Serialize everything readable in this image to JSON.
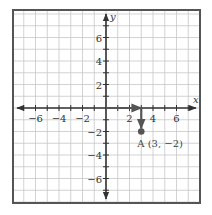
{
  "chart_data": {
    "type": "scatter",
    "title": "",
    "xlabel": "x",
    "ylabel": "y",
    "xlim": [
      -7.5,
      7.5
    ],
    "ylim": [
      -7.5,
      7.5
    ],
    "grid": true,
    "x_ticks": [
      -6,
      -4,
      -2,
      2,
      4,
      6
    ],
    "y_ticks": [
      6,
      4,
      2,
      -2,
      -4,
      -6
    ],
    "x_tick_labels": [
      "−6",
      "−4",
      "−2",
      "2",
      "4",
      "6"
    ],
    "y_tick_labels": [
      "6",
      "4",
      "2",
      "−2",
      "−4",
      "−6"
    ],
    "points": [
      {
        "name": "A",
        "x": 3,
        "y": -2,
        "label": "A (3, −2)"
      }
    ],
    "vectors": [
      {
        "from": [
          0,
          0
        ],
        "to": [
          3,
          0
        ],
        "description": "move 3 right"
      },
      {
        "from": [
          3,
          0
        ],
        "to": [
          3,
          -2
        ],
        "description": "move 2 down"
      }
    ],
    "colors": {
      "grid": "#c8c8c8",
      "axis": "#333333",
      "border": "#555555",
      "point": "#555555",
      "vector": "#555555"
    }
  }
}
